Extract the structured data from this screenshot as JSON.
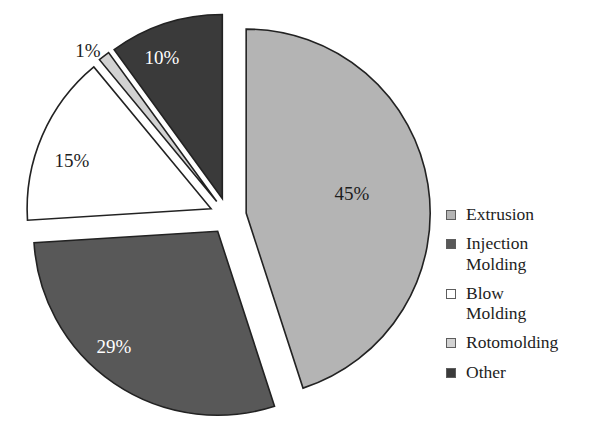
{
  "chart_data": {
    "type": "pie",
    "title": "",
    "subtitle": "",
    "xlabel": "",
    "ylabel": "",
    "grid": false,
    "legend_position": "right",
    "exploded": true,
    "start_angle_deg": 0,
    "direction": "clockwise",
    "total": 100,
    "units": "percent",
    "categories": [
      "Extrusion",
      "Injection Molding",
      "Blow Molding",
      "Rotomolding",
      "Other"
    ],
    "values": [
      45,
      29,
      15,
      1,
      10
    ],
    "labels": [
      "45%",
      "29%",
      "15%",
      "1%",
      "10%"
    ],
    "colors": [
      "#b4b4b4",
      "#585858",
      "#ffffff",
      "#d2d2d2",
      "#3a3a3a"
    ],
    "slices": [
      {
        "name": "Extrusion",
        "value": 45,
        "label": "45%",
        "color": "#b4b4b4",
        "label_color": "#1d1d1d",
        "label_x": 352,
        "label_y": 196,
        "start_deg": 0,
        "end_deg": 162,
        "explode": 0.1
      },
      {
        "name": "Injection Molding",
        "value": 29,
        "label": "29%",
        "color": "#585858",
        "label_color": "#ffffff",
        "label_x": 114,
        "label_y": 349,
        "start_deg": 162,
        "end_deg": 266.4,
        "explode": 0.1
      },
      {
        "name": "Blow Molding",
        "value": 15,
        "label": "15%",
        "color": "#ffffff",
        "label_color": "#1d1d1d",
        "label_x": 72,
        "label_y": 163,
        "start_deg": 266.4,
        "end_deg": 320.4,
        "explode": 0.1
      },
      {
        "name": "Rotomolding",
        "value": 1,
        "label": "1%",
        "color": "#d2d2d2",
        "label_color": "#1d1d1d",
        "label_x": 88,
        "label_y": 53,
        "start_deg": 320.4,
        "end_deg": 324.0,
        "explode": 0.1
      },
      {
        "name": "Other",
        "value": 10,
        "label": "10%",
        "color": "#3a3a3a",
        "label_color": "#ffffff",
        "label_x": 162,
        "label_y": 60,
        "start_deg": 324.0,
        "end_deg": 360,
        "explode": 0.1
      }
    ],
    "geometry": {
      "center_x": 228,
      "center_y": 216,
      "radius": 184
    }
  },
  "legend": {
    "items": [
      {
        "label": "Extrusion",
        "swatch_color": "#b4b4b4",
        "swatch_name": "legend-swatch-extrusion"
      },
      {
        "label": "Injection\nMolding",
        "swatch_color": "#585858",
        "swatch_name": "legend-swatch-injection-molding"
      },
      {
        "label": "Blow\nMolding",
        "swatch_color": "#ffffff",
        "swatch_name": "legend-swatch-blow-molding"
      },
      {
        "label": "Rotomolding",
        "swatch_color": "#d2d2d2",
        "swatch_name": "legend-swatch-rotomolding"
      },
      {
        "label": "Other",
        "swatch_color": "#3a3a3a",
        "swatch_name": "legend-swatch-other"
      }
    ]
  }
}
